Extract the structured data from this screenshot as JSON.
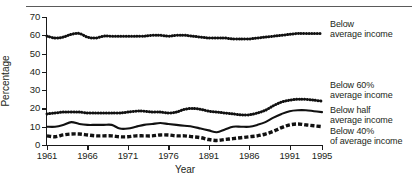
{
  "chart_data": {
    "type": "line",
    "title": "",
    "xlabel": "Year",
    "ylabel": "Percentage",
    "ylim": [
      0,
      70
    ],
    "ytick_values": [
      0,
      10,
      20,
      30,
      40,
      50,
      60,
      70
    ],
    "ytick_labels": [
      "0",
      "10",
      "20",
      "30",
      "40",
      "50",
      "60",
      "70"
    ],
    "xlim": [
      1961,
      1995
    ],
    "xtick_values": [
      1961,
      1966,
      1971,
      1976,
      1981,
      1986,
      1991,
      1995
    ],
    "xtick_labels": [
      "1961",
      "1966",
      "1971",
      "1976",
      "1891",
      "1986",
      "1991",
      "1995"
    ],
    "grid": false,
    "legend_position": "right",
    "x": [
      1961,
      1962,
      1963,
      1964,
      1965,
      1966,
      1967,
      1968,
      1969,
      1970,
      1971,
      1972,
      1973,
      1974,
      1975,
      1976,
      1977,
      1978,
      1979,
      1980,
      1981,
      1982,
      1983,
      1984,
      1985,
      1986,
      1987,
      1988,
      1989,
      1990,
      1991,
      1992,
      1993,
      1994,
      1995
    ],
    "series": [
      {
        "name": "Below average income",
        "style": "dotted",
        "values": [
          59.5,
          58.5,
          59.0,
          60.5,
          61.0,
          59.0,
          58.5,
          59.5,
          59.5,
          59.5,
          59.5,
          59.5,
          59.5,
          60.0,
          60.0,
          59.5,
          60.0,
          60.0,
          59.5,
          59.0,
          58.5,
          58.5,
          58.5,
          58.0,
          58.0,
          58.0,
          58.5,
          59.0,
          59.5,
          60.0,
          60.5,
          61.0,
          61.0,
          61.0,
          61.0
        ]
      },
      {
        "name": "Below 60% average income",
        "style": "dotted",
        "values": [
          17.0,
          17.5,
          18.0,
          18.0,
          18.0,
          17.5,
          17.5,
          17.5,
          17.5,
          17.5,
          18.0,
          18.5,
          18.5,
          18.0,
          18.0,
          17.5,
          18.0,
          19.5,
          20.0,
          19.5,
          18.5,
          18.0,
          17.5,
          17.0,
          16.5,
          16.5,
          17.5,
          19.0,
          21.5,
          23.5,
          24.5,
          25.0,
          25.0,
          24.5,
          24.0
        ]
      },
      {
        "name": "Below half average income",
        "style": "solid",
        "values": [
          10.0,
          10.0,
          11.0,
          12.5,
          11.5,
          11.0,
          11.0,
          11.0,
          11.0,
          9.0,
          9.0,
          10.0,
          11.0,
          11.5,
          12.0,
          11.5,
          11.0,
          10.5,
          10.0,
          9.0,
          8.0,
          7.0,
          8.5,
          10.0,
          10.0,
          10.0,
          11.0,
          12.5,
          15.0,
          17.0,
          18.5,
          19.0,
          19.0,
          18.5,
          18.0
        ]
      },
      {
        "name": "Below 40% of average income",
        "style": "dashed",
        "values": [
          5.0,
          4.5,
          5.5,
          6.0,
          6.0,
          5.5,
          5.0,
          5.0,
          5.0,
          4.5,
          4.5,
          5.0,
          5.0,
          5.0,
          5.5,
          5.5,
          5.0,
          5.0,
          4.5,
          4.0,
          3.0,
          2.5,
          3.0,
          3.5,
          4.0,
          4.5,
          5.0,
          6.0,
          7.5,
          9.5,
          11.0,
          11.5,
          11.0,
          10.5,
          10.0
        ]
      }
    ]
  },
  "legend": [
    {
      "line1": "Below",
      "line2": "average income"
    },
    {
      "line1": "Below 60%",
      "line2": "average income"
    },
    {
      "line1": "Below half",
      "line2": "average income"
    },
    {
      "line1": "Below 40%",
      "line2": "of average income"
    }
  ]
}
